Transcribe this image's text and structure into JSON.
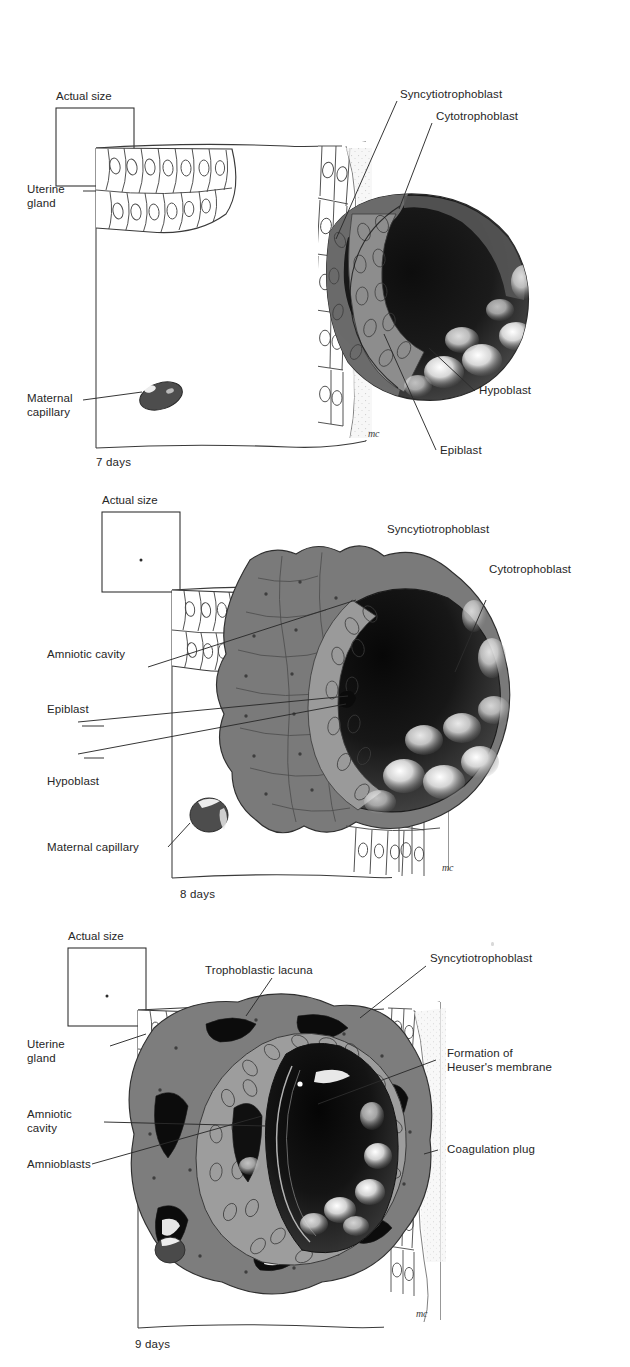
{
  "figure": {
    "ink_color": "#262626",
    "background": "#ffffff"
  },
  "panels": [
    {
      "id": "panel-7",
      "day_caption": "7 days",
      "actual_size_label": "Actual size",
      "actual_size_dot": false,
      "artist_mark": "mc",
      "labels": [
        {
          "key": "uterine_gland",
          "text": "Uterine\ngland",
          "side": "left"
        },
        {
          "key": "maternal_capillary",
          "text": "Maternal\ncapillary",
          "side": "left"
        },
        {
          "key": "syncytiotrophoblast",
          "text": "Syncytiotrophoblast",
          "side": "right"
        },
        {
          "key": "cytotrophoblast",
          "text": "Cytotrophoblast",
          "side": "right"
        },
        {
          "key": "hypoblast",
          "text": "Hypoblast",
          "side": "right"
        },
        {
          "key": "epiblast",
          "text": "Epiblast",
          "side": "right"
        }
      ]
    },
    {
      "id": "panel-8",
      "day_caption": "8 days",
      "actual_size_label": "Actual size",
      "actual_size_dot": true,
      "artist_mark": "mc",
      "labels": [
        {
          "key": "amniotic_cavity",
          "text": "Amniotic cavity",
          "side": "left"
        },
        {
          "key": "epiblast",
          "text": "Epiblast",
          "side": "left"
        },
        {
          "key": "hypoblast",
          "text": "Hypoblast",
          "side": "left"
        },
        {
          "key": "maternal_capillary",
          "text": "Maternal capillary",
          "side": "left"
        },
        {
          "key": "syncytiotrophoblast",
          "text": "Syncytiotrophoblast",
          "side": "right"
        },
        {
          "key": "cytotrophoblast",
          "text": "Cytotrophoblast",
          "side": "right"
        }
      ]
    },
    {
      "id": "panel-9",
      "day_caption": "9 days",
      "actual_size_label": "Actual size",
      "actual_size_dot": true,
      "artist_mark": "mc",
      "labels": [
        {
          "key": "uterine_gland",
          "text": "Uterine\ngland",
          "side": "left"
        },
        {
          "key": "amniotic_cavity",
          "text": "Amniotic\ncavity",
          "side": "left"
        },
        {
          "key": "amnioblasts",
          "text": "Amnioblasts",
          "side": "left"
        },
        {
          "key": "trophoblastic_lacuna",
          "text": "Trophoblastic lacuna",
          "side": "top"
        },
        {
          "key": "syncytiotrophoblast",
          "text": "Syncytiotrophoblast",
          "side": "right"
        },
        {
          "key": "heusers_membrane",
          "text": "Formation of\nHeuser's membrane",
          "side": "right"
        },
        {
          "key": "coagulation_plug",
          "text": "Coagulation plug",
          "side": "right"
        }
      ]
    }
  ]
}
